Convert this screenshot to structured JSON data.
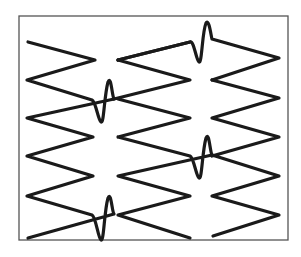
{
  "figure": {
    "frame_color": "#555555",
    "line_color": "#1a1a1a",
    "columns": 4,
    "wiggle_count": 5
  }
}
